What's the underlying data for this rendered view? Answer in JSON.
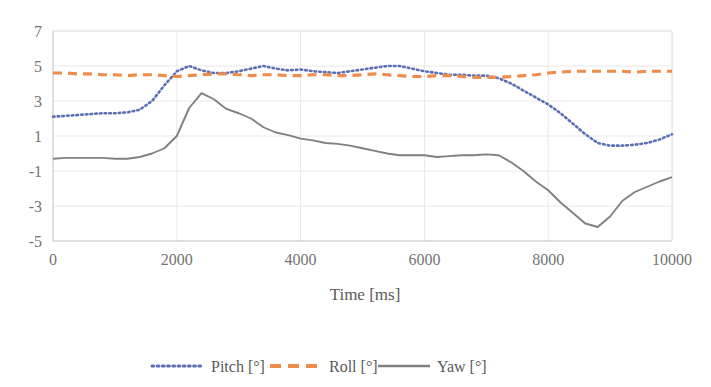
{
  "chart_data": {
    "type": "line",
    "title": "",
    "subtitle": "",
    "xlabel": "Time [ms]",
    "ylabel": "",
    "xlim": [
      0,
      10000
    ],
    "ylim": [
      -5,
      7
    ],
    "xticks": [
      0,
      2000,
      4000,
      6000,
      8000,
      10000
    ],
    "yticks": [
      7,
      5,
      3,
      1,
      -1,
      -3,
      -5
    ],
    "xtick_labels": [
      "0",
      "2000",
      "4000",
      "6000",
      "8000",
      "10000"
    ],
    "ytick_labels": [
      "7",
      "5",
      "3",
      "1",
      "-1",
      "-3",
      "-5"
    ],
    "grid": true,
    "grid_axis": "both",
    "legend_position": "bottom",
    "x": [
      0,
      200,
      400,
      600,
      800,
      1000,
      1200,
      1400,
      1600,
      1800,
      2000,
      2200,
      2400,
      2600,
      2800,
      3000,
      3200,
      3400,
      3600,
      3800,
      4000,
      4200,
      4400,
      4600,
      4800,
      5000,
      5200,
      5400,
      5600,
      5800,
      6000,
      6200,
      6400,
      6600,
      6800,
      7000,
      7200,
      7400,
      7600,
      7800,
      8000,
      8200,
      8400,
      8600,
      8800,
      9000,
      9200,
      9400,
      9600,
      9800,
      10000
    ],
    "series": [
      {
        "name": "Pitch [°]",
        "color": "#5B6FB5",
        "style": "dotted",
        "values": [
          2.1,
          2.15,
          2.2,
          2.25,
          2.3,
          2.3,
          2.35,
          2.5,
          3.0,
          3.9,
          4.7,
          5.0,
          4.75,
          4.6,
          4.6,
          4.7,
          4.85,
          5.0,
          4.85,
          4.75,
          4.8,
          4.7,
          4.65,
          4.6,
          4.7,
          4.8,
          4.9,
          5.0,
          5.0,
          4.85,
          4.7,
          4.6,
          4.5,
          4.5,
          4.45,
          4.45,
          4.3,
          4.0,
          3.6,
          3.2,
          2.8,
          2.3,
          1.7,
          1.1,
          0.6,
          0.45,
          0.45,
          0.5,
          0.6,
          0.8,
          1.1
        ]
      },
      {
        "name": "Roll [°]",
        "color": "#ED8C4B",
        "style": "dashed",
        "values": [
          4.6,
          4.6,
          4.55,
          4.55,
          4.5,
          4.5,
          4.45,
          4.5,
          4.5,
          4.45,
          4.4,
          4.45,
          4.5,
          4.55,
          4.55,
          4.5,
          4.45,
          4.5,
          4.5,
          4.45,
          4.45,
          4.5,
          4.5,
          4.45,
          4.45,
          4.5,
          4.55,
          4.5,
          4.45,
          4.4,
          4.4,
          4.45,
          4.45,
          4.4,
          4.35,
          4.35,
          4.35,
          4.4,
          4.45,
          4.5,
          4.6,
          4.65,
          4.7,
          4.7,
          4.7,
          4.7,
          4.7,
          4.65,
          4.7,
          4.7,
          4.7
        ]
      },
      {
        "name": "Yaw [°]",
        "color": "#808080",
        "style": "solid",
        "values": [
          -0.3,
          -0.25,
          -0.25,
          -0.25,
          -0.25,
          -0.3,
          -0.3,
          -0.2,
          0.0,
          0.3,
          1.0,
          2.6,
          3.45,
          3.1,
          2.55,
          2.3,
          2.0,
          1.5,
          1.2,
          1.05,
          0.85,
          0.75,
          0.6,
          0.55,
          0.45,
          0.3,
          0.15,
          0.0,
          -0.1,
          -0.1,
          -0.1,
          -0.2,
          -0.15,
          -0.1,
          -0.1,
          -0.05,
          -0.1,
          -0.5,
          -1.0,
          -1.6,
          -2.1,
          -2.8,
          -3.4,
          -4.0,
          -4.2,
          -3.6,
          -2.7,
          -2.2,
          -1.9,
          -1.6,
          -1.35
        ]
      }
    ]
  },
  "legend": {
    "items": [
      {
        "label": "Pitch [°]",
        "marker": "dotted-line-marker"
      },
      {
        "label": "Roll [°]",
        "marker": "dashed-line-marker"
      },
      {
        "label": "Yaw [°]",
        "marker": "solid-line-marker"
      }
    ]
  },
  "axes": {
    "x_title": "Time [ms]"
  }
}
